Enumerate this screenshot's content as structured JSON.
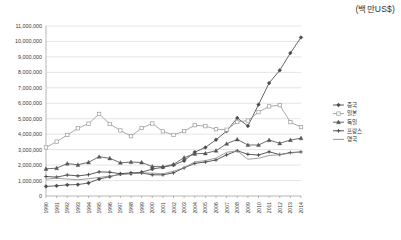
{
  "unit_note": "(백만US$)",
  "chart_data": {
    "type": "line",
    "title": "",
    "xlabel": "",
    "ylabel": "",
    "unit": "(백만US$)",
    "ylim": [
      0,
      11000000
    ],
    "ytick_step": 1000000,
    "grid": true,
    "legend_position": "right",
    "ytick_labels": [
      "0",
      "1,000,000",
      "2,000,000",
      "3,000,000",
      "4,000,000",
      "5,000,000",
      "6,000,000",
      "7,000,000",
      "8,000,000",
      "9,000,000",
      "10,000,000",
      "11,000,000"
    ],
    "categories": [
      "1990",
      "1991",
      "1992",
      "1993",
      "1994",
      "1995",
      "1996",
      "1997",
      "1998",
      "1999",
      "2000",
      "2001",
      "2002",
      "2003",
      "2004",
      "2005",
      "2006",
      "2007",
      "2008",
      "2009",
      "2010",
      "2011",
      "2012",
      "2013",
      "2014"
    ],
    "series": [
      {
        "name": "중국",
        "marker": "diamond",
        "color": "#4a4a4a",
        "values": [
          620000,
          660000,
          720000,
          740000,
          840000,
          1100000,
          1250000,
          1420000,
          1450000,
          1540000,
          1740000,
          1860000,
          2000000,
          2280000,
          2840000,
          3140000,
          3640000,
          4200000,
          5050000,
          4530000,
          5910000,
          7310000,
          8130000,
          9250000,
          10260000
        ]
      },
      {
        "name": "일본",
        "marker": "square",
        "color": "#9b9b9b",
        "values": [
          3140000,
          3520000,
          3950000,
          4380000,
          4680000,
          5310000,
          4660000,
          4240000,
          3870000,
          4400000,
          4690000,
          4180000,
          3950000,
          4200000,
          4580000,
          4520000,
          4320000,
          4290000,
          4790000,
          4880000,
          5430000,
          5800000,
          5880000,
          4780000,
          4460000
        ]
      },
      {
        "name": "독일",
        "marker": "triangle",
        "color": "#555555",
        "values": [
          1760000,
          1800000,
          2100000,
          2020000,
          2180000,
          2540000,
          2440000,
          2150000,
          2200000,
          2170000,
          1910000,
          1890000,
          2050000,
          2480000,
          2730000,
          2760000,
          2930000,
          3380000,
          3660000,
          3300000,
          3300000,
          3620000,
          3410000,
          3620000,
          3740000
        ]
      },
      {
        "name": "프랑스",
        "marker": "cross",
        "color": "#3d3d3d",
        "values": [
          1260000,
          1220000,
          1360000,
          1300000,
          1380000,
          1560000,
          1540000,
          1440000,
          1500000,
          1490000,
          1370000,
          1370000,
          1500000,
          1820000,
          2110000,
          2200000,
          2330000,
          2660000,
          2930000,
          2700000,
          2650000,
          2860000,
          2680000,
          2810000,
          2850000
        ]
      },
      {
        "name": "영국",
        "marker": "none",
        "color": "#8d8d8d",
        "values": [
          1090000,
          1150000,
          1100000,
          1050000,
          1120000,
          1200000,
          1290000,
          1380000,
          1450000,
          1490000,
          1480000,
          1440000,
          1600000,
          1840000,
          2200000,
          2290000,
          2450000,
          2830000,
          2910000,
          2380000,
          2440000,
          2620000,
          2670000,
          2780000,
          2840000
        ]
      }
    ]
  }
}
